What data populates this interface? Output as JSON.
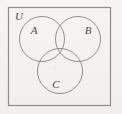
{
  "diagram": {
    "type": "venn-three-set",
    "title_visible": false,
    "universe": {
      "label": "U",
      "label_x": 19,
      "label_y": 20,
      "rect": {
        "x": 8.5,
        "y": 7.5,
        "width": 102,
        "height": 98
      },
      "stroke": "#8d8d8a",
      "stroke_width": 1.2,
      "fill": "none"
    },
    "circles": [
      {
        "name": "set-a",
        "label": "A",
        "cx": 42,
        "cy": 39,
        "r": 22.5,
        "label_x": 31,
        "label_y": 34,
        "stroke": "#86867f",
        "stroke_width": 0.9,
        "fill": "none"
      },
      {
        "name": "set-b",
        "label": "B",
        "cx": 78,
        "cy": 39,
        "r": 22.5,
        "label_x": 85,
        "label_y": 34,
        "stroke": "#86867f",
        "stroke_width": 0.9,
        "fill": "none"
      },
      {
        "name": "set-c",
        "label": "C",
        "cx": 60,
        "cy": 71,
        "r": 22.5,
        "label_x": 53,
        "label_y": 88,
        "stroke": "#86867f",
        "stroke_width": 0.9,
        "fill": "none"
      }
    ],
    "colors": {
      "background": "#f4f3f0",
      "border": "#8d8d8a",
      "circle_stroke": "#86867f",
      "label_text": "#4a4a48"
    }
  }
}
